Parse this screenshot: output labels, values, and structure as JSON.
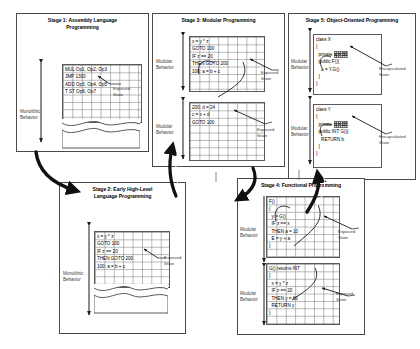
{
  "diagram": {
    "title_hidden": "Evolution of programming paradigms and state exposure",
    "labels": {
      "monolithic_behavior": "Monolithic\nBehavior",
      "modular_behavior": "Modular\nBehavior",
      "exposed_state": "Exposed\nState",
      "encapsulated_state": "Encapsulated\nState"
    },
    "stages": [
      {
        "id": "stage1",
        "title": "Stage 1: Assembly Language\nProgramming",
        "behavior_label": "Monolithic\nBehavior",
        "state_label": "Exposed\nState",
        "blocks": [
          {
            "lines": [
              "MUL Op1, Op2, Op3",
              "JMP 1300",
              "ADD Op3, Op4, Op5",
              "T ST Op6, Op7"
            ],
            "torn": true
          }
        ]
      },
      {
        "id": "stage2",
        "title": "Stage 2: Early High-Level\nLanguage Programming",
        "behavior_label": "Monolithic\nBehavior",
        "state_label": "Exposed\nState",
        "blocks": [
          {
            "lines": [
              "x = y * z",
              "GOTO 100",
              "IF z == 20",
              "THEN GOTO 200",
              "100: a = b + c"
            ],
            "torn": true
          }
        ]
      },
      {
        "id": "stage3",
        "title": "Stage 3: Modular Programming",
        "behavior_label": "Modular\nBehavior",
        "state_label": "Exposed\nState",
        "blocks": [
          {
            "lines": [
              "x = y * z",
              "GOTO 100",
              "IF z == 20",
              "THEN GOTO 200",
              "100: a = b + c"
            ],
            "torn": false
          },
          {
            "lines": [
              "200: d = 24",
              "c = x + d",
              "GOTO 100"
            ],
            "torn": false
          }
        ]
      },
      {
        "id": "stage4",
        "title": "Stage 4: Functional Programming",
        "behavior_label": "Modular\nBehavior",
        "state_label": "Exposed\nState",
        "blocks": [
          {
            "lines": [
              "F()",
              "{",
              "  y = G()",
              "  IF z == x",
              "  THEN a = 10",
              "  E = y + a",
              "}"
            ],
            "torn": false
          },
          {
            "lines": [
              "G() returns INT",
              "{",
              "  x = y * z",
              "  IF z == 20",
              "  THEN y = 60",
              "  RETURN y",
              "}"
            ],
            "torn": false
          }
        ]
      },
      {
        "id": "stage5",
        "title": "Stage 5: Object-Oriented Programming",
        "behavior_label": "Modular\nBehavior",
        "state_label": "Encapsulated\nState",
        "blocks": [
          {
            "lines": [
              "class X",
              "{",
              "  private ",
              "  public F(){",
              "    a = Y.G()",
              "  }",
              "}"
            ],
            "highlight": "a = 30",
            "highlight_line": 2,
            "torn": false
          },
          {
            "lines": [
              "class Y",
              "{",
              "  private ",
              "  public INT G(){",
              "    RETURN b",
              "  }",
              "}"
            ],
            "highlight": "b = 20",
            "highlight_line": 2,
            "torn": false
          }
        ]
      }
    ],
    "colors": {
      "border": "#4a4a4a",
      "grid": "#787878",
      "arrow": "#1a1a1a",
      "flow_arrow": "#111111",
      "label_text": "#3c3c3c",
      "highlight_fill": "#d9d9d9"
    }
  }
}
